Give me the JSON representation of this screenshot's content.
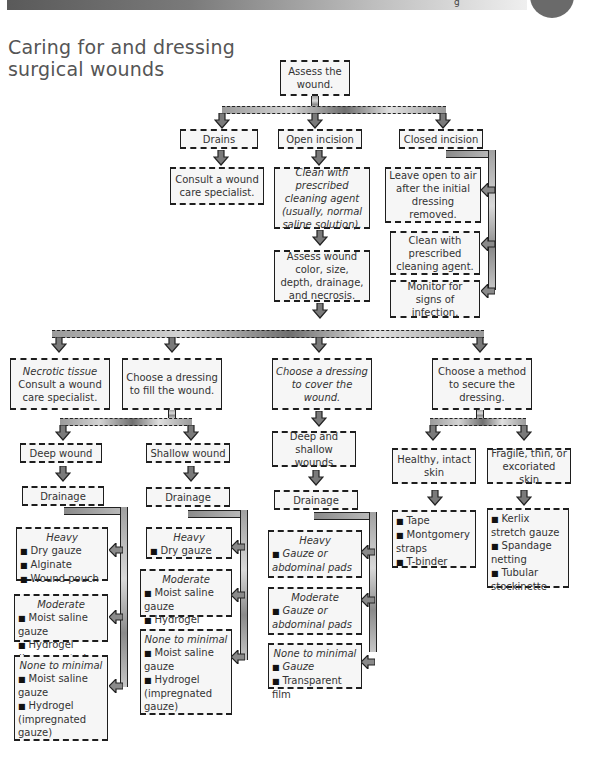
{
  "header": {
    "bar_glyph": "g",
    "title_line1": "Caring for and dressing",
    "title_line2": "surgical wounds"
  },
  "colors": {
    "box_fill": "#f6f6f6",
    "border": "#1e1e1e",
    "arrow_fill": "#7a7a7a",
    "title": "#555555"
  },
  "flow": {
    "assess": "Assess the wound.",
    "branches": {
      "drains": "Drains",
      "open": "Open incision",
      "closed": "Closed incision"
    },
    "drains_step": "Consult a wound care specialist.",
    "open_steps": [
      "Clean with prescribed cleaning agent (usually, normal saline solution).",
      "Assess wound color, size, depth, drainage, and necrosis."
    ],
    "closed_steps": [
      "Leave open to air after the initial dressing removed.",
      "Clean with prescribed cleaning agent.",
      "Monitor for signs of infection."
    ],
    "level2": {
      "necrotic_heading": "Necrotic tissue",
      "necrotic_body": "Consult a wound care specialist.",
      "fill": "Choose a dressing to fill the wound.",
      "cover": "Choose a dressing to cover the wound.",
      "secure": "Choose a method to secure the dressing."
    },
    "fill": {
      "deep": {
        "label": "Deep wound",
        "drainage": "Drainage",
        "heavy": {
          "heading": "Heavy",
          "items": [
            "Dry gauze",
            "Alginate",
            "Wound pouch"
          ]
        },
        "moderate": {
          "heading": "Moderate",
          "items": [
            "Moist saline gauze",
            "Hydrogel (impregnated gauze)"
          ]
        },
        "minimal": {
          "heading": "None to minimal",
          "items": [
            "Moist saline gauze",
            "Hydrogel (impregnated gauze)"
          ]
        }
      },
      "shallow": {
        "label": "Shallow wound",
        "drainage": "Drainage",
        "heavy": {
          "heading": "Heavy",
          "items": [
            "Dry gauze"
          ]
        },
        "moderate": {
          "heading": "Moderate",
          "items": [
            "Moist saline gauze",
            "Hydrogel (impregnated gauze)"
          ]
        },
        "minimal": {
          "heading": "None to minimal",
          "items": [
            "Moist saline gauze",
            "Hydrogel (impregnated gauze)"
          ]
        }
      }
    },
    "cover": {
      "label": "Deep and shallow wounds",
      "drainage": "Drainage",
      "heavy": {
        "heading": "Heavy",
        "items": [
          "Gauze or abdominal pads"
        ]
      },
      "moderate": {
        "heading": "Moderate",
        "items": [
          "Gauze or abdominal pads"
        ]
      },
      "minimal": {
        "heading": "None to minimal",
        "items": [
          "Gauze",
          "Transparent film"
        ]
      }
    },
    "secure": {
      "healthy": {
        "label": "Healthy, intact skin",
        "items": [
          "Tape",
          "Montgomery straps",
          "T-binder"
        ]
      },
      "fragile": {
        "label": "Fragile, thin, or excoriated skin",
        "items": [
          "Kerlix stretch gauze",
          "Spandage netting",
          "Tubular stockinette"
        ]
      }
    }
  }
}
